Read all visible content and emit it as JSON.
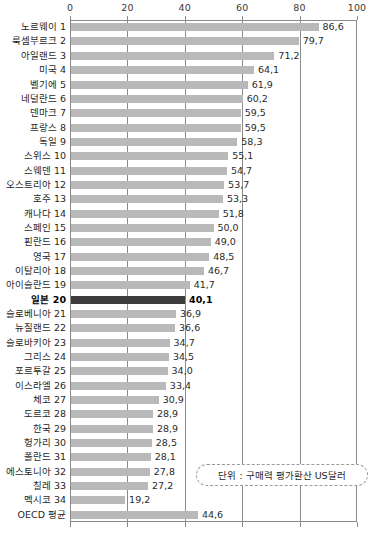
{
  "chart_data": {
    "type": "bar",
    "orientation": "horizontal",
    "title": "",
    "subtitle": "",
    "xlabel": "",
    "ylabel": "",
    "xlim": [
      0,
      100
    ],
    "xticks": [
      0,
      20,
      40,
      60,
      80,
      100
    ],
    "grid": true,
    "legend": false,
    "unit_note": "단위 : 구매력 평가환산 US달러",
    "highlight_category": "일본 20",
    "highlight_color": "#3b3b3b",
    "bar_color": "#b9b9b9",
    "categories": [
      "노르웨이 1",
      "룩셈부르크 2",
      "아일랜드 3",
      "미국 4",
      "벨기에 5",
      "네덜란드 6",
      "덴마크 7",
      "프랑스 8",
      "독일 9",
      "스위스 10",
      "스웨덴 11",
      "오스트리아 12",
      "호주 13",
      "캐나다 14",
      "스페인 15",
      "핀란드 16",
      "영국 17",
      "이탈리아 18",
      "아이슬란드 19",
      "일본 20",
      "슬로베니아 21",
      "뉴질랜드 22",
      "슬로바키아 23",
      "그리스 24",
      "포르투갈 25",
      "이스라엘 26",
      "체코 27",
      "도르코 28",
      "한국 29",
      "헝가리 30",
      "폴란드 31",
      "에스토니아 32",
      "칠레 33",
      "멕시코 34",
      "OECD 평균"
    ],
    "values": [
      86.6,
      79.7,
      71.2,
      64.1,
      61.9,
      60.2,
      59.5,
      59.5,
      58.3,
      55.1,
      54.7,
      53.7,
      53.3,
      51.8,
      50.0,
      49.0,
      48.5,
      46.7,
      41.7,
      40.1,
      36.9,
      36.6,
      34.7,
      34.5,
      34.0,
      33.4,
      30.9,
      28.9,
      28.9,
      28.5,
      28.1,
      27.8,
      27.2,
      19.2,
      44.6
    ],
    "value_labels": [
      "86,6",
      "79,7",
      "71,2",
      "64,1",
      "61,9",
      "60,2",
      "59,5",
      "59,5",
      "58,3",
      "55,1",
      "54,7",
      "53,7",
      "53,3",
      "51,8",
      "50,0",
      "49,0",
      "48,5",
      "46,7",
      "41,7",
      "40,1",
      "36,9",
      "36,6",
      "34,7",
      "34,5",
      "34,0",
      "33,4",
      "30,9",
      "28,9",
      "28,9",
      "28,5",
      "28,1",
      "27,8",
      "27,2",
      "19,2",
      "44,6"
    ]
  }
}
